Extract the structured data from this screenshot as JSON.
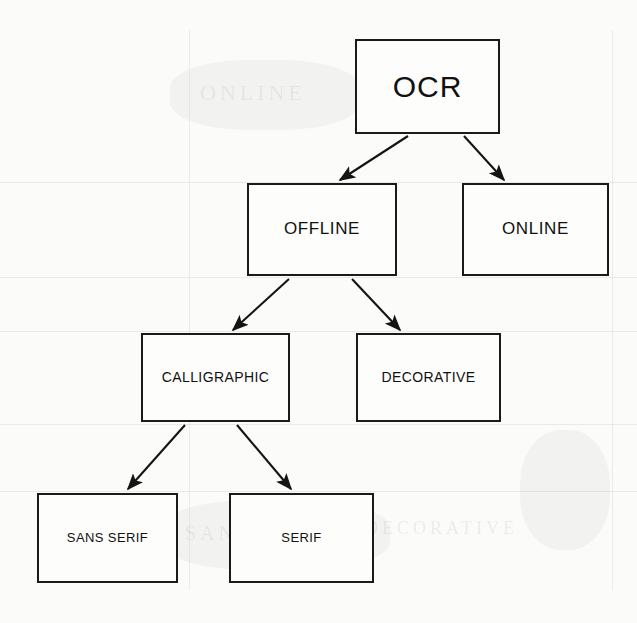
{
  "diagram": {
    "type": "tree",
    "background_color": "#fbfbf9",
    "line_color": "#1a1a1a",
    "nodes": [
      {
        "id": "ocr",
        "label": "OCR",
        "level": 0,
        "x": 355,
        "y": 39,
        "w": 145,
        "h": 95
      },
      {
        "id": "offline",
        "label": "OFFLINE",
        "level": 1,
        "x": 247,
        "y": 183,
        "w": 150,
        "h": 93
      },
      {
        "id": "online",
        "label": "ONLINE",
        "level": 1,
        "x": 462,
        "y": 183,
        "w": 147,
        "h": 93
      },
      {
        "id": "calligraphic",
        "label": "CALLIGRAPHIC",
        "level": 2,
        "x": 141,
        "y": 333,
        "w": 149,
        "h": 89
      },
      {
        "id": "decorative",
        "label": "DECORATIVE",
        "level": 2,
        "x": 356,
        "y": 333,
        "w": 145,
        "h": 89
      },
      {
        "id": "sans_serif",
        "label": "SANS SERIF",
        "level": 3,
        "x": 37,
        "y": 493,
        "w": 141,
        "h": 90
      },
      {
        "id": "serif",
        "label": "SERIF",
        "level": 3,
        "x": 229,
        "y": 493,
        "w": 145,
        "h": 90
      }
    ],
    "edges": [
      {
        "from": "ocr",
        "to": "offline",
        "x1": 408,
        "y1": 136,
        "x2": 340,
        "y2": 180
      },
      {
        "from": "ocr",
        "to": "online",
        "x1": 464,
        "y1": 136,
        "x2": 504,
        "y2": 180
      },
      {
        "from": "offline",
        "to": "calligraphic",
        "x1": 289,
        "y1": 279,
        "x2": 233,
        "y2": 330
      },
      {
        "from": "offline",
        "to": "decorative",
        "x1": 352,
        "y1": 279,
        "x2": 400,
        "y2": 330
      },
      {
        "from": "calligraphic",
        "to": "sans_serif",
        "x1": 185,
        "y1": 425,
        "x2": 128,
        "y2": 489
      },
      {
        "from": "calligraphic",
        "to": "serif",
        "x1": 237,
        "y1": 425,
        "x2": 291,
        "y2": 489
      }
    ]
  },
  "artifacts": {
    "bleed_texts": [
      {
        "text": "OCR",
        "x": 385,
        "y": 85,
        "size": 28
      },
      {
        "text": "ONLINE",
        "x": 200,
        "y": 95,
        "size": 22
      },
      {
        "text": "SANS SERIF",
        "x": 185,
        "y": 535,
        "size": 20
      },
      {
        "text": "DECORATIVE",
        "x": 365,
        "y": 530,
        "size": 18
      }
    ]
  }
}
